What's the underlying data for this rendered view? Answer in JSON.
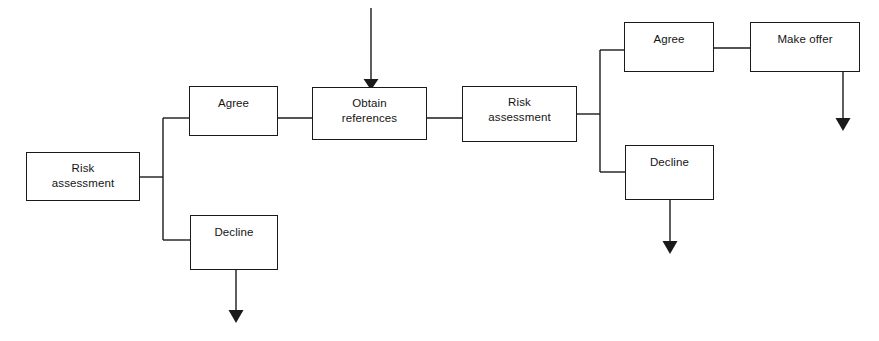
{
  "diagram": {
    "style": {
      "line_color": "#1a1a1a",
      "box_fill": "#ffffff",
      "background": "#ffffff",
      "text_color": "#151515"
    },
    "nodes": [
      {
        "id": "risk-assessment-1",
        "label": "Risk\nassessment",
        "x": 26,
        "y": 152,
        "w": 114,
        "h": 49
      },
      {
        "id": "agree-1",
        "label": "Agree",
        "x": 189,
        "y": 86,
        "w": 89,
        "h": 50
      },
      {
        "id": "decline-1",
        "label": "Decline",
        "x": 190,
        "y": 215,
        "w": 88,
        "h": 55
      },
      {
        "id": "obtain-references",
        "label": "Obtain\nreferences",
        "x": 312,
        "y": 87,
        "w": 115,
        "h": 53
      },
      {
        "id": "risk-assessment-2",
        "label": "Risk\nassessment",
        "x": 462,
        "y": 86,
        "w": 115,
        "h": 56
      },
      {
        "id": "agree-2",
        "label": "Agree",
        "x": 624,
        "y": 22,
        "w": 90,
        "h": 50
      },
      {
        "id": "decline-2",
        "label": "Decline",
        "x": 625,
        "y": 145,
        "w": 89,
        "h": 55
      },
      {
        "id": "make-offer",
        "label": "Make offer",
        "x": 750,
        "y": 22,
        "w": 110,
        "h": 50
      }
    ],
    "edges": [
      {
        "id": "edge-risk1-to-junction1",
        "from": "risk-assessment-1",
        "to": "branch-junction-1",
        "path": "M 140 177 L 163 177"
      },
      {
        "id": "branch-junction-1",
        "from": "branch-junction-1",
        "to": "agree-1-and-decline-1",
        "path": "M 163 118 L 163 240"
      },
      {
        "id": "edge-junction1-to-agree1",
        "from": "branch-junction-1",
        "to": "agree-1",
        "path": "M 163 118 L 189 118"
      },
      {
        "id": "edge-junction1-to-decline1",
        "from": "branch-junction-1",
        "to": "decline-1",
        "path": "M 163 240 L 190 240"
      },
      {
        "id": "edge-agree1-to-obtain",
        "from": "agree-1",
        "to": "obtain-references",
        "path": "M 278 118 L 312 118"
      },
      {
        "id": "edge-obtain-to-risk2",
        "from": "obtain-references",
        "to": "risk-assessment-2",
        "path": "M 427 118 L 462 118"
      },
      {
        "id": "edge-risk2-to-junction2",
        "from": "risk-assessment-2",
        "to": "branch-junction-2",
        "path": "M 577 114 L 600 114"
      },
      {
        "id": "branch-junction-2",
        "from": "branch-junction-2",
        "to": "agree-2-and-decline-2",
        "path": "M 600 50 L 600 172"
      },
      {
        "id": "edge-junction2-to-agree2",
        "from": "branch-junction-2",
        "to": "agree-2",
        "path": "M 600 50 L 624 50"
      },
      {
        "id": "edge-junction2-to-decline2",
        "from": "branch-junction-2",
        "to": "decline-2",
        "path": "M 600 172 L 625 172"
      },
      {
        "id": "edge-agree2-to-makeoffer",
        "from": "agree-2",
        "to": "make-offer",
        "path": "M 714 48 L 750 48"
      }
    ],
    "arrows": [
      {
        "id": "arrow-input-to-obtain",
        "label": "incoming-arrow",
        "path": "M 371 8 L 371 80",
        "tip": [
          371,
          88
        ],
        "direction": "down"
      },
      {
        "id": "arrow-out-decline-1",
        "label": "exit-arrow",
        "path": "M 236 270 L 236 312",
        "tip": [
          236,
          322
        ],
        "direction": "down"
      },
      {
        "id": "arrow-out-decline-2",
        "label": "exit-arrow",
        "path": "M 670 200 L 670 243",
        "tip": [
          670,
          253
        ],
        "direction": "down"
      },
      {
        "id": "arrow-out-make-offer",
        "label": "exit-arrow",
        "path": "M 843 72 L 843 120",
        "tip": [
          843,
          130
        ],
        "direction": "down"
      }
    ]
  }
}
